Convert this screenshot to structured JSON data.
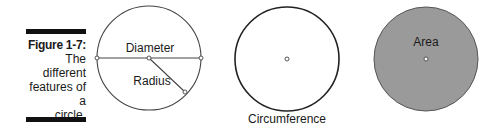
{
  "figure": {
    "number_label": "Figure 1-7:",
    "caption": "The different features of a circle.",
    "caption_lines": [
      "The",
      "different",
      "features of a",
      "circle."
    ]
  },
  "diagrams": [
    {
      "name": "diameter-radius",
      "labels": {
        "diameter": "Diameter",
        "radius": "Radius"
      }
    },
    {
      "name": "circumference",
      "labels": {
        "circumference": "Circumference"
      }
    },
    {
      "name": "area",
      "labels": {
        "area": "Area"
      },
      "fill_color": "#9a9a9a"
    }
  ],
  "colors": {
    "stroke": "#333333",
    "area_fill": "#9a9a9a",
    "bar": "#111111"
  }
}
